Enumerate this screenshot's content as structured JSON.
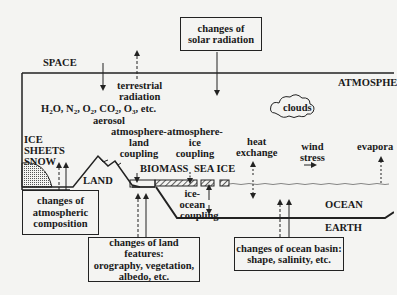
{
  "regions": {
    "space": "SPACE",
    "atmosphere": "ATMOSPHE",
    "ocean": "OCEAN",
    "earth": "EARTH",
    "land": "LAND",
    "biomass": "BIOMASS",
    "sea_ice": "SEA ICE",
    "ice_sheets": [
      "ICE",
      "SHEETS",
      "SNOW"
    ],
    "clouds": "clouds"
  },
  "processes": {
    "terrestrial_radiation": [
      "terrestrial",
      "radiation"
    ],
    "gases": "H2O, N2, O2, CO2, O3, etc.",
    "aerosol": "aerosol",
    "atmosphere_land_coupling": [
      "atmosphere-",
      "land",
      "coupling"
    ],
    "atmosphere_ice_coupling": [
      "atmosphere-",
      "ice",
      "coupling"
    ],
    "heat_exchange": [
      "heat",
      "exchange"
    ],
    "wind_stress": [
      "wind",
      "stress"
    ],
    "evaporation": "evapora",
    "ice_ocean_coupling": [
      "ice-",
      "ocean",
      "coupling"
    ]
  },
  "boxes": {
    "solar": [
      "changes of",
      "solar radiation"
    ],
    "atmospheric": [
      "changes of",
      "atmospheric",
      "composition"
    ],
    "land_features": [
      "changes of land features:",
      "orography, vegetation,",
      "albedo, etc."
    ],
    "ocean_basin": [
      "changes of ocean basin:",
      "shape, salinity, etc."
    ]
  }
}
